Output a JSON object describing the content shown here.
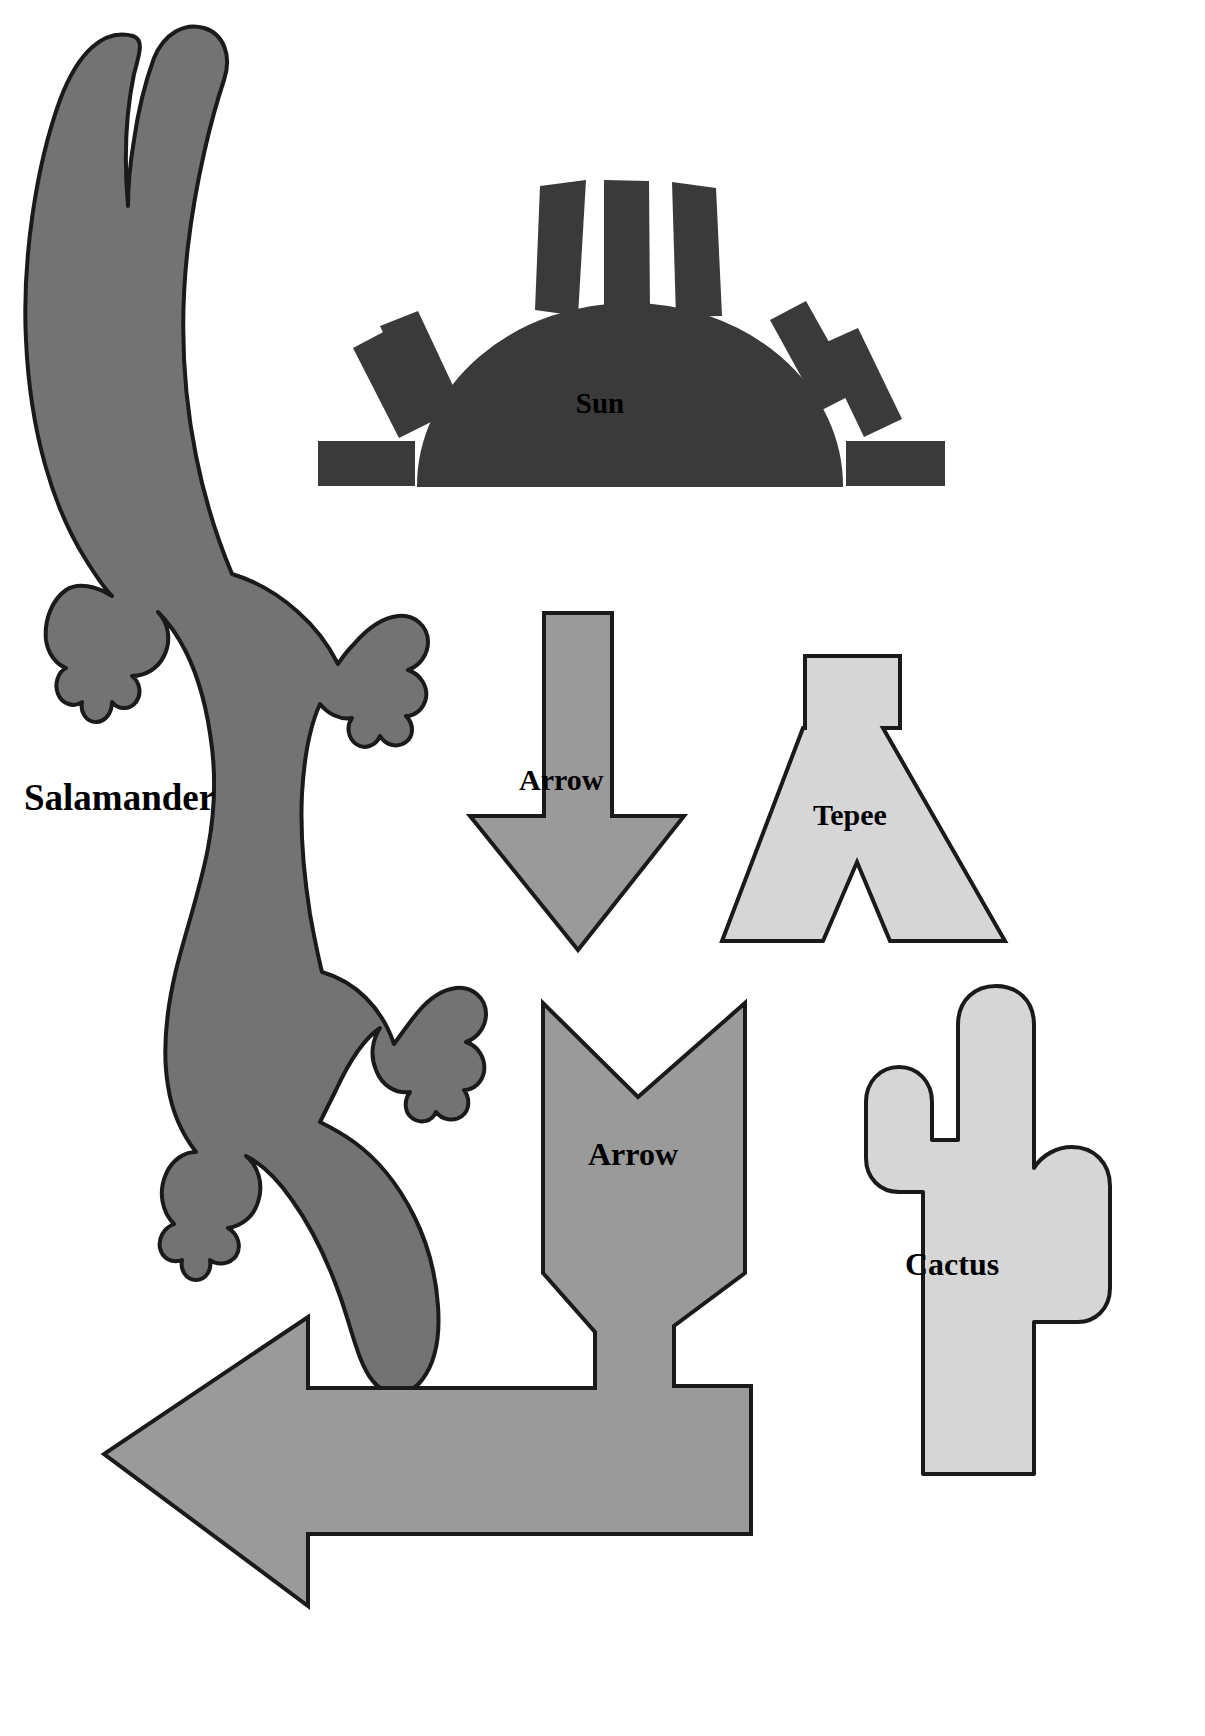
{
  "page": {
    "background_color": "#ffffff",
    "width": 1205,
    "height": 1736,
    "kind": "shape-template-sheet"
  },
  "palette": {
    "outline": "#1a1a1a",
    "salamander_fill": "#737373",
    "sun_fill": "#3a3a3a",
    "arrow_fill": "#9a9a9a",
    "tepee_fill": "#d6d6d6",
    "cactus_fill": "#d6d6d6",
    "label_color": "#000000"
  },
  "shapes": [
    {
      "id": "salamander",
      "label": "Salamander",
      "fill": "#737373",
      "label_x": 24,
      "label_y": 810
    },
    {
      "id": "sun",
      "label": "Sun",
      "fill": "#3a3a3a",
      "label_x": 600,
      "label_y": 413
    },
    {
      "id": "arrow-down",
      "label": "Arrow",
      "fill": "#9a9a9a",
      "label_x": 519,
      "label_y": 790
    },
    {
      "id": "tepee",
      "label": "Tepee",
      "fill": "#d6d6d6",
      "label_x": 813,
      "label_y": 825
    },
    {
      "id": "arrow-bent",
      "label": "Arrow",
      "fill": "#9a9a9a",
      "label_x": 588,
      "label_y": 1165
    },
    {
      "id": "cactus",
      "label": "Cactus",
      "fill": "#d6d6d6",
      "label_x": 905,
      "label_y": 1275
    }
  ],
  "sun": {
    "ray_count": 9,
    "ray_color": "#3a3a3a",
    "dome_color": "#3a3a3a"
  },
  "labels": {
    "salamander": "Salamander",
    "sun": "Sun",
    "arrow_down": "Arrow",
    "tepee": "Tepee",
    "arrow_bent": "Arrow",
    "cactus": "Cactus"
  }
}
